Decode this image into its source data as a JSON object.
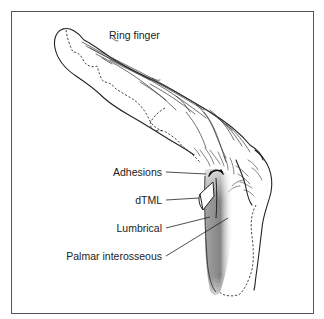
{
  "figure": {
    "title_label": "Ring finger",
    "labels": {
      "adhesions": "Adhesions",
      "dtml": "dTML",
      "lumbrical": "Lumbrical",
      "palmar_interosseous": "Palmar interosseous"
    },
    "colors": {
      "frame": "#555555",
      "ink": "#222222",
      "shading": "#7a7a7a",
      "background": "#ffffff"
    }
  }
}
